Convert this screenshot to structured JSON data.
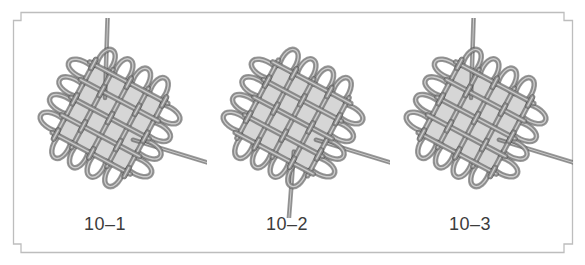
{
  "figure": {
    "frame_color": "#bdbdbd",
    "cord_color": "#8a8a8a",
    "cord_highlight": "#d2d2d2",
    "cord_shadow": "#4a4a4a",
    "panels": [
      {
        "label": "10–1",
        "step": 1,
        "image": "knot-step-1-photo",
        "tails": {
          "top_right": true,
          "bottom_left": false,
          "bottom_right": true
        }
      },
      {
        "label": "10–2",
        "step": 2,
        "image": "knot-step-2-photo",
        "tails": {
          "top_right": false,
          "bottom_left": true,
          "bottom_right": true
        }
      },
      {
        "label": "10–3",
        "step": 3,
        "image": "knot-step-3-photo",
        "tails": {
          "top_right": true,
          "bottom_left": false,
          "bottom_right": true
        }
      }
    ]
  }
}
